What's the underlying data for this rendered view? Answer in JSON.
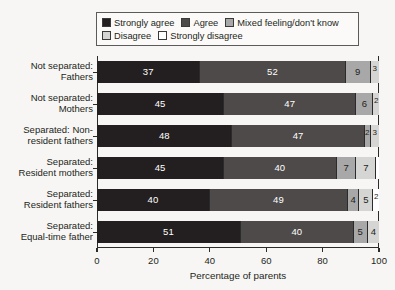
{
  "title_remnant": "",
  "legend": {
    "rows": [
      [
        {
          "label": "Strongly agree",
          "color": "#231f20",
          "icon": "legend-swatch"
        },
        {
          "label": "Agree",
          "color": "#4d4a49",
          "icon": "legend-swatch"
        },
        {
          "label": "Mixed feeling/don't know",
          "color": "#a8a8a8",
          "icon": "legend-swatch"
        }
      ],
      [
        {
          "label": "Disagree",
          "color": "#d5d5d3",
          "icon": "legend-swatch"
        },
        {
          "label": "Strongly disagree",
          "color": "#ffffff",
          "icon": "legend-swatch"
        }
      ]
    ]
  },
  "chart_data": {
    "type": "bar",
    "orientation": "horizontal",
    "stacked": true,
    "title": "",
    "xlabel": "Percentage of parents",
    "ylabel": "",
    "xlim": [
      0,
      100
    ],
    "xticks": [
      0,
      20,
      40,
      60,
      80,
      100
    ],
    "xtick_labels": [
      "0",
      "20",
      "40",
      "60",
      "80",
      "100"
    ],
    "grid": false,
    "legend_position": "top",
    "categories": [
      "Not separated:\nFathers",
      "Not separated:\nMothers",
      "Separated: Non-\nresident fathers",
      "Separated:\nResident mothers",
      "Separated:\nResident fathers",
      "Separated:\nEqual-time father"
    ],
    "category_lines": [
      [
        "Not separated:",
        "Fathers"
      ],
      [
        "Not separated:",
        "Mothers"
      ],
      [
        "Separated: Non-",
        "resident fathers"
      ],
      [
        "Separated:",
        "Resident mothers"
      ],
      [
        "Separated:",
        "Resident fathers"
      ],
      [
        "Separated:",
        "Equal-time father"
      ]
    ],
    "series": [
      {
        "name": "Strongly agree",
        "color": "#231f20",
        "text_color": "#ffffff",
        "values": [
          37,
          45,
          48,
          45,
          40,
          51
        ]
      },
      {
        "name": "Agree",
        "color": "#4d4a49",
        "text_color": "#ffffff",
        "values": [
          52,
          47,
          47,
          40,
          49,
          40
        ]
      },
      {
        "name": "Mixed feeling/don't know",
        "color": "#a8a8a8",
        "text_color": "#231f20",
        "values": [
          9,
          6,
          2,
          7,
          4,
          5
        ]
      },
      {
        "name": "Disagree",
        "color": "#d5d5d3",
        "text_color": "#231f20",
        "values": [
          3,
          2,
          3,
          7,
          5,
          4
        ]
      },
      {
        "name": "Strongly disagree",
        "color": "#ffffff",
        "text_color": "#231f20",
        "values": [
          0,
          0,
          0,
          1,
          2,
          0
        ]
      }
    ],
    "bar_labels": [
      [
        "37",
        "52",
        "9",
        "3",
        ""
      ],
      [
        "45",
        "47",
        "6",
        "2",
        ""
      ],
      [
        "48",
        "47",
        "2",
        "3",
        ""
      ],
      [
        "45",
        "40",
        "7",
        "7",
        ""
      ],
      [
        "40",
        "49",
        "4",
        "5",
        "2"
      ],
      [
        "51",
        "40",
        "5",
        "4",
        "0"
      ]
    ]
  }
}
